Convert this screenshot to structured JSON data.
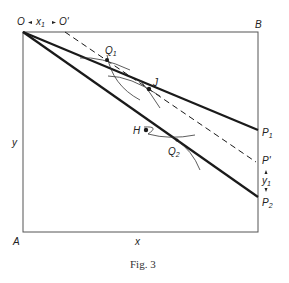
{
  "figure": {
    "caption": "Fig. 3",
    "labels": {
      "O": "O",
      "x1": "x",
      "x1_sub": "1",
      "O_prime": "O'",
      "B": "B",
      "A": "A",
      "y": "y",
      "x": "x",
      "Q1": "Q",
      "Q1_sub": "1",
      "Q2": "Q",
      "Q2_sub": "2",
      "J": "J",
      "H": "H",
      "P1": "P",
      "P1_sub": "1",
      "P_prime": "P'",
      "y1": "y",
      "y1_sub": "1",
      "P2": "P",
      "P2_sub": "2"
    },
    "colors": {
      "line": "#1a1a1a",
      "box": "#555555",
      "text": "#222222"
    }
  }
}
